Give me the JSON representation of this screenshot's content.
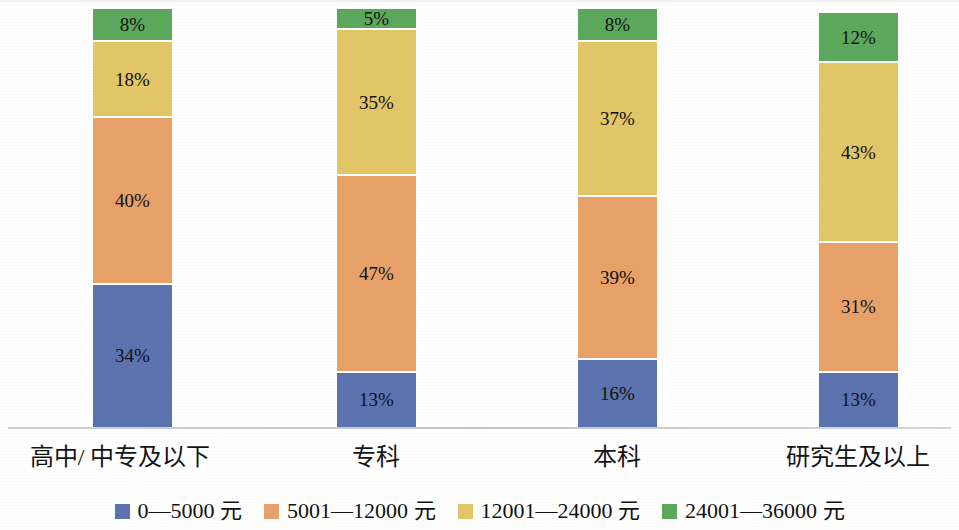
{
  "chart_data": {
    "type": "bar",
    "title": "",
    "subtitle": "",
    "xlabel": "",
    "ylabel": "",
    "stacked": true,
    "stack_total_percent": 100,
    "ylim": [
      0,
      100
    ],
    "grid": false,
    "legend_position": "bottom",
    "value_suffix": "%",
    "categories": [
      "高中/ 中专及以下",
      "专科",
      "本科",
      "研究生及以上"
    ],
    "series": [
      {
        "name": "0—5000 元",
        "color": "#5c73b0",
        "values": [
          34,
          13,
          16,
          13
        ],
        "labels": [
          "34%",
          "13%",
          "16%",
          "13%"
        ]
      },
      {
        "name": "5001—12000 元",
        "color": "#e8a269",
        "values": [
          40,
          47,
          39,
          31
        ],
        "labels": [
          "40%",
          "47%",
          "39%",
          "31%"
        ]
      },
      {
        "name": "12001—24000 元",
        "color": "#e2c667",
        "values": [
          18,
          35,
          37,
          43
        ],
        "labels": [
          "18%",
          "35%",
          "37%",
          "43%"
        ]
      },
      {
        "name": "24001—36000 元",
        "color": "#5ca85c",
        "values": [
          8,
          5,
          8,
          12
        ],
        "labels": [
          "8%",
          "5%",
          "8%",
          "12%"
        ]
      }
    ]
  },
  "legend": {
    "items": [
      {
        "label": "0—5000 元",
        "color": "#5c73b0"
      },
      {
        "label": "5001—12000 元",
        "color": "#e8a269"
      },
      {
        "label": "12001—24000 元",
        "color": "#e2c667"
      },
      {
        "label": "24001—36000 元",
        "color": "#5ca85c"
      }
    ]
  },
  "axis": {
    "baseline_color": "#c6cace"
  },
  "bars": [
    {
      "category": "高中/ 中专及以下",
      "left": 93,
      "label_center": 120,
      "segments": [
        {
          "series": "0—5000 元",
          "value": 34,
          "label": "34%",
          "color": "#5c73b0"
        },
        {
          "series": "5001—12000 元",
          "value": 40,
          "label": "40%",
          "color": "#e8a269"
        },
        {
          "series": "12001—24000 元",
          "value": 18,
          "label": "18%",
          "color": "#e2c667"
        },
        {
          "series": "24001—36000 元",
          "value": 8,
          "label": "8%",
          "color": "#5ca85c"
        }
      ]
    },
    {
      "category": "专科",
      "left": 337,
      "label_center": 376,
      "segments": [
        {
          "series": "0—5000 元",
          "value": 13,
          "label": "13%",
          "color": "#5c73b0"
        },
        {
          "series": "5001—12000 元",
          "value": 47,
          "label": "47%",
          "color": "#e8a269"
        },
        {
          "series": "12001—24000 元",
          "value": 35,
          "label": "35%",
          "color": "#e2c667"
        },
        {
          "series": "24001—36000 元",
          "value": 5,
          "label": "5%",
          "color": "#5ca85c"
        }
      ]
    },
    {
      "category": "本科",
      "left": 578,
      "label_center": 617,
      "segments": [
        {
          "series": "0—5000 元",
          "value": 16,
          "label": "16%",
          "color": "#5c73b0"
        },
        {
          "series": "5001—12000 元",
          "value": 39,
          "label": "39%",
          "color": "#e8a269"
        },
        {
          "series": "12001—24000 元",
          "value": 37,
          "label": "37%",
          "color": "#e2c667"
        },
        {
          "series": "24001—36000 元",
          "value": 8,
          "label": "8%",
          "color": "#5ca85c"
        }
      ]
    },
    {
      "category": "研究生及以上",
      "left": 819,
      "label_center": 858,
      "segments": [
        {
          "series": "0—5000 元",
          "value": 13,
          "label": "13%",
          "color": "#5c73b0"
        },
        {
          "series": "5001—12000 元",
          "value": 31,
          "label": "31%",
          "color": "#e8a269"
        },
        {
          "series": "12001—24000 元",
          "value": 43,
          "label": "43%",
          "color": "#e2c667"
        },
        {
          "series": "24001—36000 元",
          "value": 12,
          "label": "12%",
          "color": "#5ca85c"
        }
      ]
    }
  ]
}
